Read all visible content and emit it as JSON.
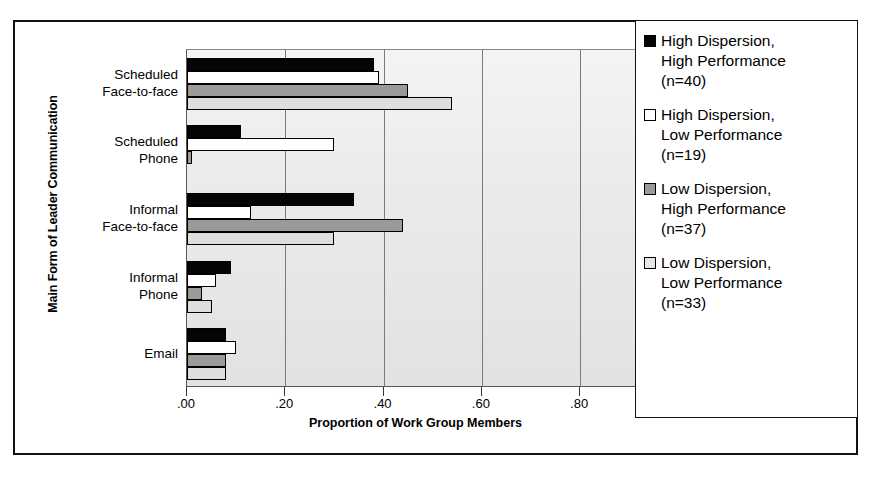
{
  "chart_data": {
    "type": "bar",
    "orientation": "horizontal",
    "title": "",
    "xlabel": "Proportion of Work Group Members",
    "ylabel": "Main Form of Leader Communication",
    "xlim": [
      0.0,
      0.934
    ],
    "xticks": [
      0.0,
      0.2,
      0.4,
      0.6,
      0.8
    ],
    "xticklabels": [
      ".00",
      ".20",
      ".40",
      ".60",
      ".80"
    ],
    "grid": true,
    "legend_position": "right",
    "categories": [
      "Scheduled\nFace-to-face",
      "Scheduled\nPhone",
      "Informal\nFace-to-face",
      "Informal\nPhone",
      "Email"
    ],
    "series": [
      {
        "name": "High Dispersion, High Performance (n=40)",
        "color": "#050505",
        "values": [
          0.38,
          0.11,
          0.34,
          0.09,
          0.08
        ]
      },
      {
        "name": "High Dispersion, Low Performance (n=19)",
        "color": "#ffffff",
        "values": [
          0.39,
          0.3,
          0.13,
          0.06,
          0.1
        ]
      },
      {
        "name": "Low Dispersion, High Performance (n=37)",
        "color": "#9a9a9a",
        "values": [
          0.45,
          0.01,
          0.44,
          0.03,
          0.08
        ]
      },
      {
        "name": "Low Dispersion, Low Performance (n=33)",
        "color": "#dedede",
        "values": [
          0.54,
          0.0,
          0.3,
          0.05,
          0.08
        ]
      }
    ]
  },
  "axes": {
    "y_title": "Main Form of Leader Communication",
    "x_title": "Proportion of Work Group Members"
  },
  "legend": {
    "items": [
      {
        "swatch": "black-swatch",
        "label": "High Dispersion,\nHigh Performance\n(n=40)"
      },
      {
        "swatch": "white-swatch",
        "label": "High Dispersion,\nLow Performance\n(n=19)"
      },
      {
        "swatch": "gray-swatch",
        "label": "Low Dispersion,\nHigh Performance\n(n=37)"
      },
      {
        "swatch": "light-gray-swatch",
        "label": "Low Dispersion,\nLow Performance\n(n=33)"
      }
    ]
  }
}
